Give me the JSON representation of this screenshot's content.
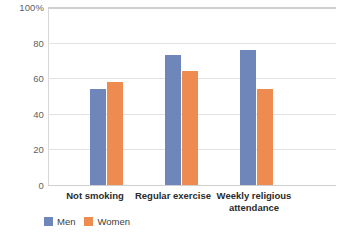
{
  "chart_data": {
    "type": "bar",
    "title": "",
    "xlabel": "",
    "ylabel": "",
    "ylim": [
      0,
      100
    ],
    "grid": true,
    "legend_position": "bottom-left",
    "categories": [
      "Not smoking",
      "Regular exercise",
      "Weekly religious attendance"
    ],
    "ytick_labels": [
      "100%",
      "80",
      "60",
      "40",
      "20",
      "0"
    ],
    "ytick_values": [
      100,
      80,
      60,
      40,
      20,
      0
    ],
    "series": [
      {
        "name": "Men",
        "color": "#6f86ba",
        "values": [
          54,
          73,
          76
        ]
      },
      {
        "name": "Women",
        "color": "#ed8b51",
        "values": [
          58,
          64,
          54
        ]
      }
    ]
  }
}
